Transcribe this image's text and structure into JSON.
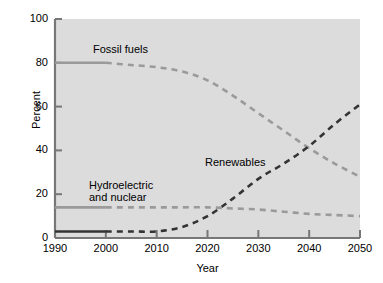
{
  "chart_data": {
    "type": "line",
    "title": "",
    "xlabel": "Year",
    "ylabel": "Percent",
    "xlim": [
      1990,
      2050
    ],
    "ylim": [
      0,
      100
    ],
    "xticks": [
      1990,
      2000,
      2010,
      2020,
      2030,
      2040,
      2050
    ],
    "yticks": [
      0,
      20,
      40,
      60,
      80,
      100
    ],
    "grid": false,
    "legend_position": "inline-annotations",
    "background_color": "#dcdcdc",
    "series": [
      {
        "name": "Fossil fuels",
        "color": "#9a9a9a",
        "historical_style": "solid",
        "projected_style": "dashed",
        "historical_end_year": 2000,
        "x": [
          1990,
          1995,
          2000,
          2005,
          2010,
          2015,
          2020,
          2025,
          2030,
          2035,
          2040,
          2045,
          2050
        ],
        "values": [
          80,
          80,
          80,
          79,
          78,
          76,
          72,
          65,
          57,
          49,
          41,
          34,
          28
        ]
      },
      {
        "name": "Renewables",
        "color": "#333333",
        "historical_style": "solid",
        "projected_style": "dashed",
        "historical_end_year": 2000,
        "x": [
          1990,
          1995,
          2000,
          2005,
          2010,
          2015,
          2020,
          2025,
          2030,
          2035,
          2040,
          2045,
          2050
        ],
        "values": [
          3,
          3,
          3,
          3,
          3,
          5,
          10,
          18,
          27,
          34,
          42,
          52,
          61
        ]
      },
      {
        "name": "Hydroelectric and nuclear",
        "label_lines": [
          "Hydroelectric",
          "and nuclear"
        ],
        "color": "#9a9a9a",
        "historical_style": "solid",
        "projected_style": "dashed",
        "historical_end_year": 2000,
        "x": [
          1990,
          1995,
          2000,
          2005,
          2010,
          2015,
          2020,
          2025,
          2030,
          2035,
          2040,
          2045,
          2050
        ],
        "values": [
          14,
          14,
          14,
          14,
          14,
          14,
          14,
          13.5,
          13,
          12,
          11,
          10.5,
          10
        ]
      }
    ],
    "annotations": [
      {
        "text": "Fossil fuels",
        "x": 2002,
        "y": 88
      },
      {
        "text": "Hydroelectric\nand nuclear",
        "x": 1999,
        "y": 26
      },
      {
        "text": "Renewables",
        "x": 2026,
        "y": 38
      }
    ]
  }
}
